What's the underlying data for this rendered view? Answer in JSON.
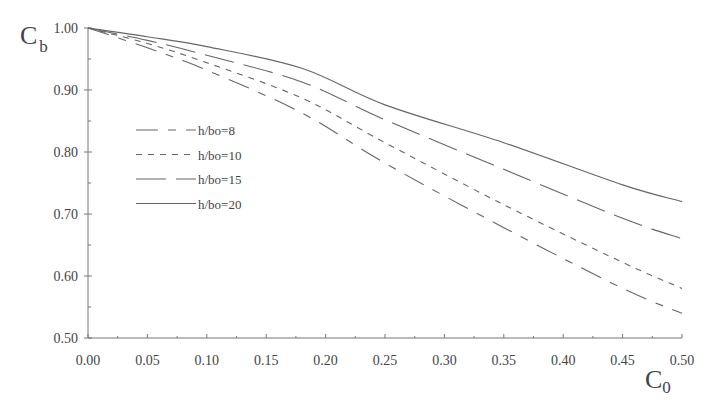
{
  "chart_data": {
    "type": "line",
    "title": "",
    "xlabel": "C0",
    "xlabel_main": "C",
    "xlabel_sub": "0",
    "ylabel": "Cb",
    "ylabel_main": "C",
    "ylabel_sub": "b",
    "xlim": [
      0.0,
      0.5
    ],
    "ylim": [
      0.5,
      1.0
    ],
    "grid": false,
    "legend_position": "upper-left inside",
    "x_ticks": [
      "0.00",
      "0.05",
      "0.10",
      "0.15",
      "0.20",
      "0.25",
      "0.30",
      "0.35",
      "0.40",
      "0.45",
      "0.50"
    ],
    "y_ticks": [
      "0.50",
      "0.60",
      "0.70",
      "0.80",
      "0.90",
      "1.00"
    ],
    "x": [
      0.0,
      0.05,
      0.1,
      0.18,
      0.25,
      0.35,
      0.45,
      0.5
    ],
    "series": [
      {
        "name": "h/bo=8",
        "dash": "long-short",
        "values": [
          1.0,
          0.968,
          0.932,
          0.863,
          0.782,
          0.678,
          0.58,
          0.54
        ]
      },
      {
        "name": "h/bo=10",
        "dash": "short",
        "values": [
          1.0,
          0.975,
          0.944,
          0.887,
          0.815,
          0.715,
          0.622,
          0.58
        ]
      },
      {
        "name": "h/bo=15",
        "dash": "long",
        "values": [
          1.0,
          0.98,
          0.956,
          0.913,
          0.852,
          0.772,
          0.693,
          0.66
        ]
      },
      {
        "name": "h/bo=20",
        "dash": "solid",
        "values": [
          1.0,
          0.986,
          0.97,
          0.935,
          0.876,
          0.815,
          0.747,
          0.72
        ]
      }
    ]
  }
}
